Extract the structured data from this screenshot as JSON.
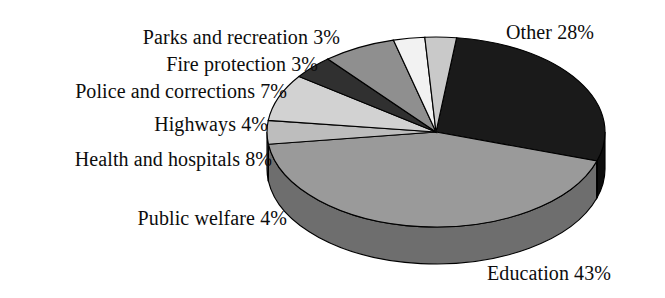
{
  "chart_data": {
    "type": "pie",
    "title": "",
    "subtitle": "",
    "xlabel": "",
    "ylabel": "",
    "legend_position": "none",
    "grid": false,
    "labels_inline": true,
    "units": "percent",
    "total": 100,
    "categories": [
      "Other",
      "Education",
      "Public welfare",
      "Health and hospitals",
      "Highways",
      "Police and corrections",
      "Fire protection",
      "Parks and recreation"
    ],
    "values": [
      28,
      43,
      4,
      8,
      4,
      7,
      3,
      3
    ],
    "slices": [
      {
        "name": "Other",
        "value": 28,
        "label": "Other 28%",
        "color": "#1a1a1a",
        "side_color": "#0d0d0d",
        "label_position": "top-right"
      },
      {
        "name": "Education",
        "value": 43,
        "label": "Education 43%",
        "color": "#9a9a9a",
        "side_color": "#6e6e6e",
        "label_position": "bottom-right"
      },
      {
        "name": "Public welfare",
        "value": 4,
        "label": "Public welfare 4%",
        "color": "#bdbdbd",
        "side_color": "#8a8a8a",
        "label_position": "left"
      },
      {
        "name": "Health and hospitals",
        "value": 8,
        "label": "Health and hospitals 8%",
        "color": "#d2d2d2",
        "side_color": "#9c9c9c",
        "label_position": "left"
      },
      {
        "name": "Highways",
        "value": 4,
        "label": "Highways 4%",
        "color": "#303030",
        "side_color": "#1f1f1f",
        "label_position": "left"
      },
      {
        "name": "Police and corrections",
        "value": 7,
        "label": "Police and corrections 7%",
        "color": "#8f8f8f",
        "side_color": "#666666",
        "label_position": "left"
      },
      {
        "name": "Fire protection",
        "value": 3,
        "label": "Fire protection 3%",
        "color": "#f2f2f2",
        "side_color": "#bbbbbb",
        "label_position": "left"
      },
      {
        "name": "Parks and recreation",
        "value": 3,
        "label": "Parks and recreation 3%",
        "color": "#c9c9c9",
        "side_color": "#949494",
        "label_position": "left"
      }
    ],
    "background_color": "#ffffff",
    "text_color": "#0d0d0d",
    "style": "3d-pie-grayscale"
  }
}
